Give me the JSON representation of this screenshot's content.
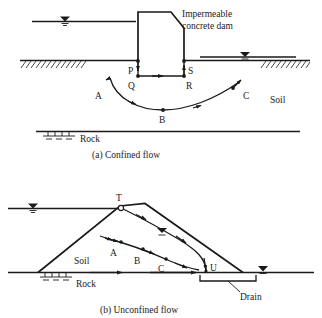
{
  "figure": {
    "title_text": "",
    "colors": {
      "ink": "#1a1a1a",
      "background": "#ffffff"
    }
  },
  "panel_a": {
    "caption": "(a)  Confined flow",
    "caption_index": "(a)",
    "caption_text": "Confined flow",
    "annotations": {
      "structure_label_line1": "Impermeable",
      "structure_label_line2": "concrete dam",
      "soil_label": "Soil",
      "rock_label": "Rock"
    },
    "points": [
      {
        "id": "P",
        "label": "P"
      },
      {
        "id": "Q",
        "label": "Q"
      },
      {
        "id": "R",
        "label": "R"
      },
      {
        "id": "S",
        "label": "S"
      },
      {
        "id": "A",
        "label": "A"
      },
      {
        "id": "B",
        "label": "B"
      },
      {
        "id": "C",
        "label": "C"
      }
    ],
    "symbols": {
      "upstream_water_table": "water-table-symbol",
      "downstream_water_table": "water-table-symbol",
      "rock_support": "rock-support-symbol"
    }
  },
  "panel_b": {
    "caption": "(b)  Unconfined flow",
    "caption_index": "(b)",
    "caption_text": "Unconfined flow",
    "annotations": {
      "soil_label": "Soil",
      "rock_label": "Rock",
      "drain_label": "Drain"
    },
    "points": [
      {
        "id": "T",
        "label": "T"
      },
      {
        "id": "A",
        "label": "A"
      },
      {
        "id": "B",
        "label": "B"
      },
      {
        "id": "C",
        "label": "C"
      },
      {
        "id": "U",
        "label": "U"
      }
    ],
    "symbols": {
      "upstream_water_table": "water-table-symbol",
      "phreatic_water_table": "water-table-symbol",
      "downstream_water_table": "water-table-symbol",
      "rock_support": "rock-support-symbol"
    }
  }
}
